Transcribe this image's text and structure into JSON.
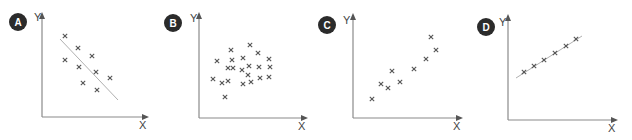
{
  "colors": {
    "badge": "#2b2b2b",
    "badge_text": "#ffffff",
    "axis": "#8a8a8a",
    "trend_line": "#b0b0b0",
    "marker": "#555555",
    "background": "#ffffff"
  },
  "chart_data": [
    {
      "type": "scatter",
      "title": "A",
      "xlabel": "X",
      "ylabel": "Y",
      "marker": "x",
      "description": "negative correlation",
      "trend_line": true,
      "points": [
        [
          65,
          36
        ],
        [
          78,
          48
        ],
        [
          92,
          56
        ],
        [
          65,
          60
        ],
        [
          79,
          67
        ],
        [
          96,
          72
        ],
        [
          110,
          78
        ],
        [
          83,
          83
        ],
        [
          97,
          90
        ]
      ],
      "line": [
        [
          60,
          39
        ],
        [
          118,
          100
        ]
      ],
      "grid": false
    },
    {
      "type": "scatter",
      "title": "B",
      "xlabel": "X",
      "ylabel": "Y",
      "marker": "x",
      "description": "no correlation",
      "trend_line": false,
      "points": [
        [
          250,
          45
        ],
        [
          231,
          50
        ],
        [
          258,
          53
        ],
        [
          217,
          61
        ],
        [
          232,
          60
        ],
        [
          243,
          58
        ],
        [
          269,
          59
        ],
        [
          228,
          68
        ],
        [
          233,
          68
        ],
        [
          242,
          70
        ],
        [
          249,
          66
        ],
        [
          259,
          67
        ],
        [
          270,
          67
        ],
        [
          248,
          75
        ],
        [
          213,
          79
        ],
        [
          222,
          83
        ],
        [
          228,
          81
        ],
        [
          243,
          84
        ],
        [
          251,
          82
        ],
        [
          260,
          78
        ],
        [
          269,
          77
        ],
        [
          225,
          97
        ]
      ],
      "grid": false
    },
    {
      "type": "scatter",
      "title": "C",
      "xlabel": "X",
      "ylabel": "Y",
      "marker": "x",
      "description": "positive correlation",
      "trend_line": false,
      "points": [
        [
          431,
          37
        ],
        [
          436,
          50
        ],
        [
          426,
          59
        ],
        [
          392,
          71
        ],
        [
          414,
          69
        ],
        [
          400,
          82
        ],
        [
          381,
          84
        ],
        [
          388,
          88
        ],
        [
          372,
          99
        ]
      ],
      "grid": false
    },
    {
      "type": "scatter",
      "title": "D",
      "xlabel": "X",
      "ylabel": "Y",
      "marker": "x",
      "description": "strong positive correlation",
      "trend_line": true,
      "points": [
        [
          524,
          72
        ],
        [
          534,
          66
        ],
        [
          544,
          60
        ],
        [
          555,
          53
        ],
        [
          566,
          46
        ],
        [
          576,
          39
        ]
      ],
      "line": [
        [
          516,
          78
        ],
        [
          582,
          36
        ]
      ],
      "grid": false
    }
  ],
  "panels": [
    {
      "badge": "A",
      "y_label": "Y",
      "x_label": "X",
      "badge_c": [
        18,
        22
      ],
      "y_label_pos": [
        34,
        21
      ],
      "x_label_pos": [
        139,
        129
      ],
      "axis_x": 42,
      "axis_top": 12,
      "axis_bottom": 117,
      "axis_right": 149
    },
    {
      "badge": "B",
      "y_label": "Y",
      "x_label": "X",
      "badge_c": [
        173,
        23
      ],
      "y_label_pos": [
        190,
        22
      ],
      "x_label_pos": [
        298,
        130
      ],
      "axis_x": 199,
      "axis_top": 12,
      "axis_bottom": 118,
      "axis_right": 308
    },
    {
      "badge": "C",
      "y_label": "Y",
      "x_label": "X",
      "badge_c": [
        327,
        25
      ],
      "y_label_pos": [
        343,
        24
      ],
      "x_label_pos": [
        453,
        130
      ],
      "axis_x": 353,
      "axis_top": 13,
      "axis_bottom": 118,
      "axis_right": 463
    },
    {
      "badge": "D",
      "y_label": "Y",
      "x_label": "X",
      "badge_c": [
        486,
        27
      ],
      "y_label_pos": [
        499,
        26
      ],
      "x_label_pos": [
        608,
        132
      ],
      "axis_x": 508,
      "axis_top": 14,
      "axis_bottom": 120,
      "axis_right": 618
    }
  ]
}
